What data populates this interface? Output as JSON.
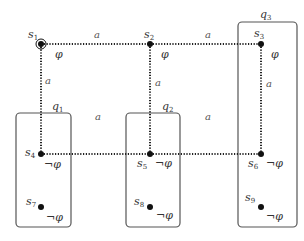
{
  "diagram": {
    "type": "kripke-structure-partition",
    "states": [
      {
        "id": "s1",
        "name": "s",
        "index": "1",
        "x": 41,
        "y": 44,
        "prop": "φ",
        "initial": true
      },
      {
        "id": "s2",
        "name": "s",
        "index": "2",
        "x": 150,
        "y": 44,
        "prop": "φ",
        "initial": false
      },
      {
        "id": "s3",
        "name": "s",
        "index": "3",
        "x": 261,
        "y": 44,
        "prop": "φ",
        "initial": false
      },
      {
        "id": "s4",
        "name": "s",
        "index": "4",
        "x": 41,
        "y": 154,
        "prop": "¬φ",
        "initial": false
      },
      {
        "id": "s5",
        "name": "s",
        "index": "5",
        "x": 150,
        "y": 154,
        "prop": "¬φ",
        "initial": false
      },
      {
        "id": "s6",
        "name": "s",
        "index": "6",
        "x": 261,
        "y": 154,
        "prop": "¬φ",
        "initial": false
      },
      {
        "id": "s7",
        "name": "s",
        "index": "7",
        "x": 41,
        "y": 207,
        "prop": "¬φ",
        "initial": false
      },
      {
        "id": "s8",
        "name": "s",
        "index": "8",
        "x": 150,
        "y": 207,
        "prop": "¬φ",
        "initial": false
      },
      {
        "id": "s9",
        "name": "s",
        "index": "9",
        "x": 261,
        "y": 207,
        "prop": "¬φ",
        "initial": false
      }
    ],
    "edges": [
      {
        "from": "s1",
        "to": "s2",
        "label": "a"
      },
      {
        "from": "s2",
        "to": "s3",
        "label": "a"
      },
      {
        "from": "s1",
        "to": "s4",
        "label": "a"
      },
      {
        "from": "s2",
        "to": "s5",
        "label": "a"
      },
      {
        "from": "s3",
        "to": "s6",
        "label": "a"
      },
      {
        "from": "s4",
        "to": "s5",
        "label": "a"
      },
      {
        "from": "s5",
        "to": "s6",
        "label": "a"
      }
    ],
    "groups": [
      {
        "id": "q1",
        "name": "q",
        "index": "1",
        "members": [
          "s4",
          "s7"
        ]
      },
      {
        "id": "q2",
        "name": "q",
        "index": "2",
        "members": [
          "s5",
          "s8"
        ]
      },
      {
        "id": "q3",
        "name": "q",
        "index": "3",
        "members": [
          "s3",
          "s6",
          "s9"
        ]
      }
    ]
  }
}
